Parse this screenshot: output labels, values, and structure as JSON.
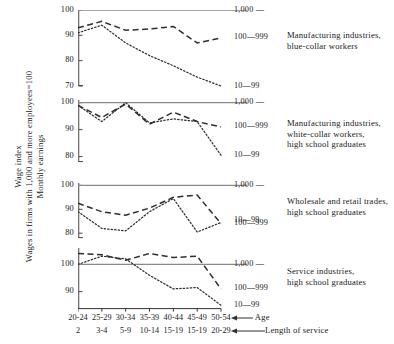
{
  "axis_title": {
    "lines": [
      "Wage index",
      "Wages in firms with 1,000 and more employees=100",
      "Monthly earnings"
    ]
  },
  "annotations": {
    "age_label": "Age",
    "service_label": "Length of service"
  },
  "series_keys": {
    "large": "1,000 —",
    "medium": "100—999",
    "small": "10—99"
  },
  "chart_data": {
    "type": "line",
    "title": "",
    "xlabel": "Age / Length of service",
    "ylabel": "Wage index (Wages in firms with 1,000 and more employees=100), Monthly earnings",
    "grid": false,
    "legend_position": "right",
    "categories_age": [
      "20-24",
      "25-29",
      "30-34",
      "35-39",
      "40-44",
      "45-49",
      "50-54"
    ],
    "categories_service": [
      "2",
      "3-4",
      "5-9",
      "10-14",
      "15-19",
      "15-19",
      "20-29"
    ],
    "panels": [
      {
        "caption_lines": [
          "Manufacturing industries,",
          "blue-collar workers"
        ],
        "ylim": [
          70,
          100
        ],
        "yticks": [
          100,
          90,
          80,
          70
        ],
        "reference_value": 100,
        "series": [
          {
            "name": "1,000 —",
            "style": "solid",
            "values": [
              100,
              100,
              100,
              100,
              100,
              100,
              100
            ],
            "label_value": 100
          },
          {
            "name": "100—999",
            "style": "dashed",
            "values": [
              93,
              95.5,
              92,
              92.5,
              93.5,
              87,
              89
            ],
            "label_value": 89
          },
          {
            "name": "10—99",
            "style": "dotted",
            "values": [
              91,
              94,
              87,
              82,
              78,
              73.5,
              70
            ],
            "label_value": 70
          }
        ]
      },
      {
        "caption_lines": [
          "Manufacturing industries,",
          "white-collar workers,",
          "high school graduates"
        ],
        "ylim": [
          78,
          101
        ],
        "yticks": [
          100,
          90,
          80
        ],
        "reference_value": 100,
        "series": [
          {
            "name": "1,000 —",
            "style": "solid",
            "values": [
              100,
              100,
              100,
              100,
              100,
              100,
              100
            ],
            "label_value": 100
          },
          {
            "name": "100—999",
            "style": "dashed",
            "values": [
              99,
              94.5,
              99.5,
              92,
              96.5,
              93,
              91
            ],
            "label_value": 91
          },
          {
            "name": "10—99",
            "style": "dotted",
            "values": [
              99,
              93,
              100,
              92.5,
              94,
              93,
              80.5
            ],
            "label_value": 80.5
          }
        ]
      },
      {
        "caption_lines": [
          "Wholesale and retail trades,",
          "high school graduates"
        ],
        "ylim": [
          78,
          101
        ],
        "yticks": [
          100,
          90,
          80
        ],
        "reference_value": 100,
        "series": [
          {
            "name": "1,000 —",
            "style": "solid",
            "values": [
              100,
              100,
              100,
              100,
              100,
              100,
              100
            ],
            "label_value": 100
          },
          {
            "name": "100—999",
            "style": "dashed",
            "values": [
              92.5,
              89,
              87.5,
              90.5,
              95,
              96,
              84
            ],
            "label_value": 84
          },
          {
            "name": "10—99",
            "style": "dotted",
            "values": [
              89,
              82,
              81,
              89,
              94.5,
              80.5,
              84.5
            ],
            "label_value": 85.5
          }
        ]
      },
      {
        "caption_lines": [
          "Service industries,",
          "high school graduates"
        ],
        "ylim": [
          84,
          106
        ],
        "yticks": [
          100,
          90
        ],
        "reference_value": 100,
        "series": [
          {
            "name": "1,000 —",
            "style": "solid",
            "values": [
              100,
              100,
              100,
              100,
              100,
              100,
              100
            ],
            "label_value": 100
          },
          {
            "name": "100—999",
            "style": "dashed",
            "values": [
              104,
              103.5,
              101.5,
              104,
              102.5,
              103,
              91
            ],
            "label_value": 91
          },
          {
            "name": "10—99",
            "style": "dotted",
            "values": [
              100,
              103,
              102,
              96,
              91,
              91.5,
              85
            ],
            "label_value": 85
          }
        ]
      }
    ]
  }
}
